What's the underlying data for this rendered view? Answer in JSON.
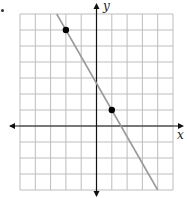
{
  "chart_data": {
    "type": "line",
    "title": "",
    "xlabel": "x",
    "ylabel": "y",
    "xlim": [
      -5,
      5
    ],
    "ylim": [
      -4,
      7
    ],
    "grid": true,
    "tick_labels": false,
    "series": [
      {
        "name": "line",
        "slope": -1.6667,
        "intercept": 2.6667,
        "x": [
          -2.6,
          4
        ],
        "y": [
          7,
          -4
        ]
      }
    ],
    "points": [
      {
        "x": -2,
        "y": 6
      },
      {
        "x": 1,
        "y": 1
      }
    ]
  },
  "labels": {
    "x_axis": "x",
    "y_axis": "y"
  },
  "colors": {
    "grid": "#bdbdbd",
    "axis": "#111111",
    "line": "#9a9a9a",
    "point": "#000000"
  }
}
